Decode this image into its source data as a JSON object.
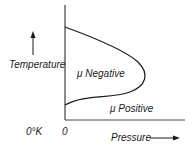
{
  "diagram": {
    "type": "inversion-curve",
    "y_axis_label": "Temperature",
    "x_axis_label": "Pressure",
    "origin_temperature_label": "0°K",
    "origin_pressure_label": "0",
    "region_inside_label": "μ Negative",
    "region_outside_label": "μ Positive",
    "line_color": "#1a1a1a"
  }
}
